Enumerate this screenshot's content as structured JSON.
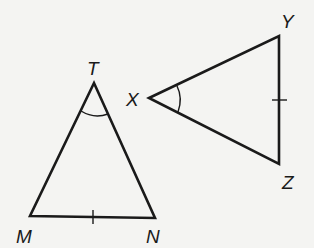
{
  "diagram": {
    "triangle_tmn": {
      "vertices": {
        "T": "T",
        "M": "M",
        "N": "N"
      },
      "marks": {
        "angle_at": "T",
        "tick_on_side": "MN"
      }
    },
    "triangle_xyz": {
      "vertices": {
        "X": "X",
        "Y": "Y",
        "Z": "Z"
      },
      "marks": {
        "angle_at": "X",
        "tick_on_side": "YZ"
      }
    },
    "colors": {
      "line": "#1a1a1a",
      "background": "#f4f4f2"
    }
  }
}
